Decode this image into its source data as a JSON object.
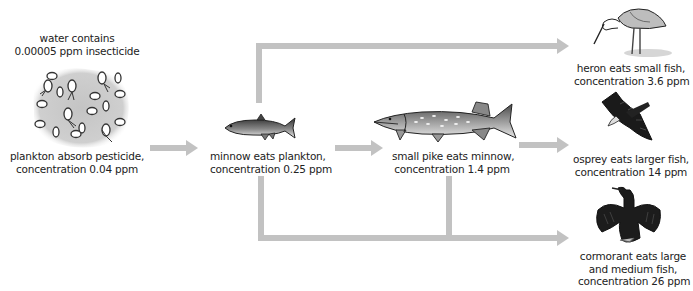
{
  "diagram": {
    "title_note": {
      "line1": "water contains",
      "line2": "0.00005 ppm insecticide"
    },
    "nodes": [
      {
        "id": "plankton",
        "line1": "plankton absorb pesticide,",
        "line2": "concentration 0.04 ppm",
        "icon": "plankton-icon"
      },
      {
        "id": "minnow",
        "line1": "minnow eats plankton,",
        "line2": "concentration 0.25 ppm",
        "icon": "minnow-icon"
      },
      {
        "id": "pike",
        "line1": "small pike eats minnow,",
        "line2": "concentration 1.4 ppm",
        "icon": "pike-icon"
      },
      {
        "id": "heron",
        "line1": "heron eats small fish,",
        "line2": "concentration 3.6 ppm",
        "icon": "heron-icon"
      },
      {
        "id": "osprey",
        "line1": "osprey eats larger fish,",
        "line2": "concentration 14 ppm",
        "icon": "osprey-icon"
      },
      {
        "id": "cormorant",
        "line1": "cormorant eats large",
        "line2": "and medium fish,",
        "line3": "concentration 26 ppm",
        "icon": "cormorant-icon"
      }
    ],
    "edges": [
      {
        "from": "plankton",
        "to": "minnow"
      },
      {
        "from": "minnow",
        "to": "pike"
      },
      {
        "from": "minnow",
        "to": "heron"
      },
      {
        "from": "minnow",
        "to": "cormorant"
      },
      {
        "from": "pike",
        "to": "osprey"
      },
      {
        "from": "pike",
        "to": "cormorant"
      }
    ],
    "colors": {
      "arrow": "#c2c2c2",
      "blob": "#c8c8c8",
      "ink": "#222222"
    }
  }
}
